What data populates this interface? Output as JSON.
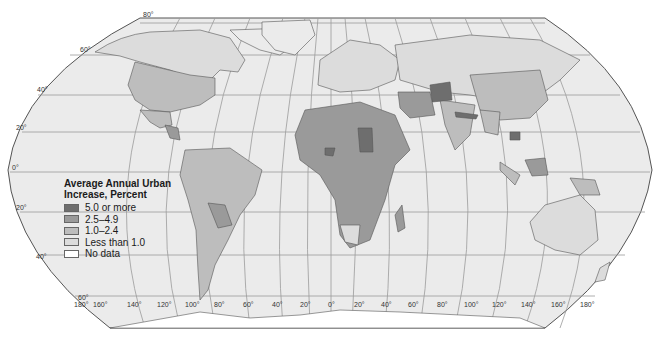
{
  "map": {
    "projection": "Robinson-like world map, grayscale choropleth",
    "legend": {
      "title_line1": "Average Annual Urban",
      "title_line2": "Increase, Percent",
      "items": [
        {
          "label": "5.0 or more",
          "color": "#6e6e6e"
        },
        {
          "label": "2.5–4.9",
          "color": "#9a9a9a"
        },
        {
          "label": "1.0–2.4",
          "color": "#bdbdbd"
        },
        {
          "label": "Less than 1.0",
          "color": "#dcdcdc"
        },
        {
          "label": "No data",
          "color": "#ffffff"
        }
      ]
    },
    "latitude_labels": [
      "80°",
      "60°",
      "40°",
      "20°",
      "0°",
      "20°",
      "40°",
      "60°"
    ],
    "longitude_labels": [
      "180°",
      "160°",
      "140°",
      "120°",
      "100°",
      "80°",
      "60°",
      "40°",
      "20°",
      "0°",
      "20°",
      "40°",
      "60°",
      "80°",
      "100°",
      "120°",
      "140°",
      "160°",
      "180°"
    ],
    "colors": {
      "ocean": "#ebebeb",
      "graticule": "#8a8a8a",
      "border": "#555555"
    }
  }
}
